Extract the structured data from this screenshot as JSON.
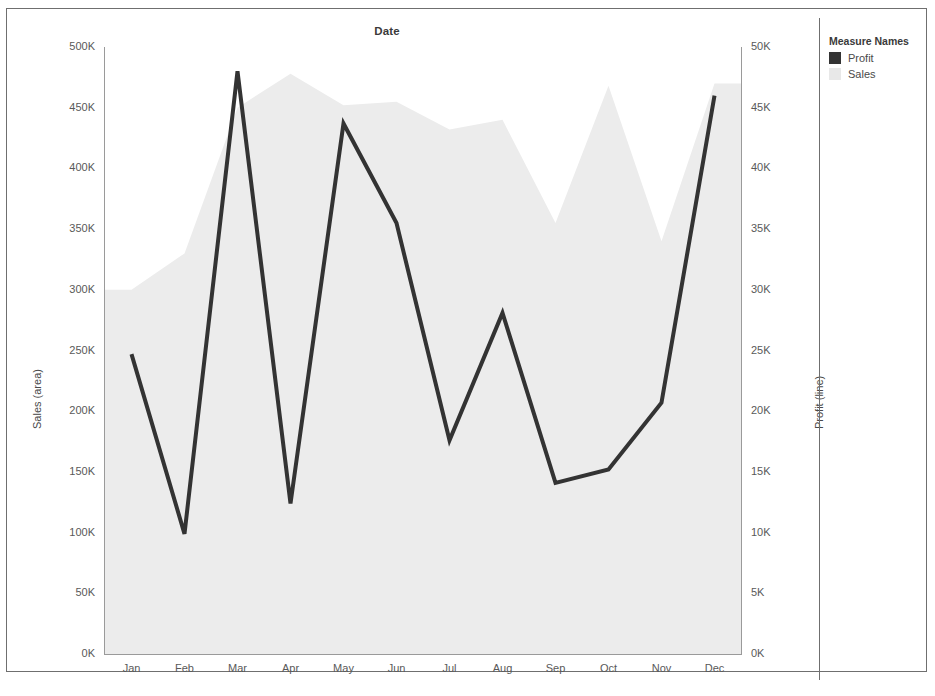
{
  "chart_data": {
    "type": "area",
    "title": "Date",
    "xlabel": "",
    "categories": [
      "Jan",
      "Feb",
      "Mar",
      "Apr",
      "May",
      "Jun",
      "Jul",
      "Aug",
      "Sep",
      "Oct",
      "Nov",
      "Dec"
    ],
    "grid": false,
    "legend_position": "right",
    "axes": {
      "left": {
        "label": "Sales (area)",
        "ticks": [
          "500K",
          "450K",
          "400K",
          "350K",
          "300K",
          "250K",
          "200K",
          "150K",
          "100K",
          "50K",
          "0K"
        ],
        "tick_values": [
          500000,
          450000,
          400000,
          350000,
          300000,
          250000,
          200000,
          150000,
          100000,
          50000,
          0
        ],
        "range": [
          0,
          500000
        ]
      },
      "right": {
        "label": "Profit (line)",
        "ticks": [
          "50K",
          "45K",
          "40K",
          "35K",
          "30K",
          "25K",
          "20K",
          "15K",
          "10K",
          "5K",
          "0K"
        ],
        "tick_values": [
          50000,
          45000,
          40000,
          35000,
          30000,
          25000,
          20000,
          15000,
          10000,
          5000,
          0
        ],
        "range": [
          0,
          50000
        ]
      }
    },
    "series": [
      {
        "name": "Sales",
        "render": "area",
        "axis": "left",
        "color": "#ececec",
        "values": [
          300000,
          330000,
          450000,
          478000,
          452000,
          455000,
          432000,
          440000,
          355000,
          468000,
          340000,
          470000
        ]
      },
      {
        "name": "Profit",
        "render": "line",
        "axis": "right",
        "color": "#333333",
        "values": [
          24700,
          9900,
          48000,
          12400,
          43700,
          35500,
          17600,
          28100,
          14100,
          15200,
          20700,
          46000
        ]
      }
    ]
  },
  "legend": {
    "title": "Measure Names",
    "items": [
      {
        "label": "Profit",
        "color": "#333333"
      },
      {
        "label": "Sales",
        "color": "#e8e8e8"
      }
    ]
  }
}
